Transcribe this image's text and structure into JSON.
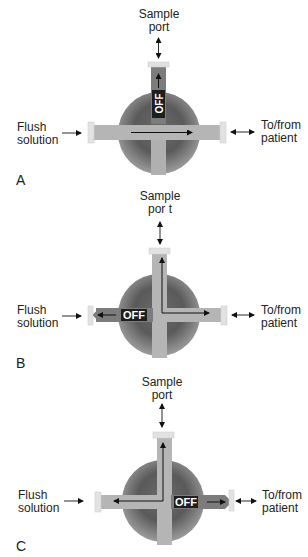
{
  "figure": {
    "colors": {
      "sphere_dark": "#4a4a4a",
      "sphere_light": "#a8a8a8",
      "channel_open": "#b5b5b5",
      "channel_off": "#7a7a7a",
      "port_cap": "#e2e2e2",
      "off_label_bg": "#1e1e1e",
      "off_label_text": "#ffffff"
    },
    "panels": [
      {
        "letter": "A",
        "sample_port_line1": "Sample",
        "sample_port_line2": "port",
        "flush_line1": "Flush",
        "flush_line2": "solution",
        "patient_line1": "To/from",
        "patient_line2": "patient",
        "off_label": "OFF",
        "off_direction": "sample port"
      },
      {
        "letter": "B",
        "sample_port_line1": "Sample",
        "sample_port_line2": "por t",
        "flush_line1": "Flush",
        "flush_line2": "solution",
        "patient_line1": "To/from",
        "patient_line2": "patient",
        "off_label": "OFF",
        "off_direction": "flush solution"
      },
      {
        "letter": "C",
        "sample_port_line1": "Sample",
        "sample_port_line2": "port",
        "flush_line1": "Flush",
        "flush_line2": "solution",
        "patient_line1": "To/from",
        "patient_line2": "patient",
        "off_label": "OFF",
        "off_direction": "patient"
      }
    ]
  }
}
